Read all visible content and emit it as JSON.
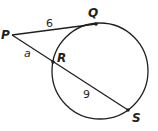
{
  "diagram": {
    "type": "circle-secant-tangent",
    "stroke_color": "#231f20",
    "circle": {
      "cx": 100,
      "cy": 71,
      "r": 48
    },
    "points": {
      "P": {
        "label": "P",
        "x": 12,
        "y": 35
      },
      "Q": {
        "label": "Q",
        "x": 96,
        "y": 24
      },
      "R": {
        "label": "R",
        "x": 53,
        "y": 62
      },
      "S": {
        "label": "S",
        "x": 128,
        "y": 110
      }
    },
    "segments": {
      "PQ": {
        "label": "6"
      },
      "PR": {
        "label": "a"
      },
      "RS": {
        "label": "9"
      }
    }
  }
}
